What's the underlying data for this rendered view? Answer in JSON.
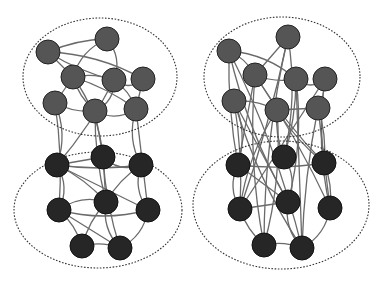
{
  "diagram": {
    "type": "network-community-comparison",
    "colors": {
      "top_node": "#555555",
      "bottom_node": "#262626",
      "edge": "#6a6a6a",
      "cluster_outline": "#333333"
    },
    "node_radius": 12,
    "panels": [
      {
        "id": "left",
        "clusters": [
          {
            "id": "top",
            "cx": 100,
            "cy": 77,
            "rx": 77,
            "ry": 59,
            "nodes": [
              [
                48,
                52
              ],
              [
                107,
                39
              ],
              [
                73,
                77
              ],
              [
                114,
                80
              ],
              [
                143,
                79
              ],
              [
                55,
                103
              ],
              [
                95,
                111
              ],
              [
                136,
                109
              ]
            ]
          },
          {
            "id": "bottom",
            "cx": 98,
            "cy": 210,
            "rx": 84,
            "ry": 58,
            "nodes": [
              [
                57,
                165
              ],
              [
                103,
                157
              ],
              [
                141,
                165
              ],
              [
                59,
                210
              ],
              [
                106,
                202
              ],
              [
                148,
                210
              ],
              [
                82,
                246
              ],
              [
                120,
                248
              ]
            ]
          }
        ],
        "intra_edges_top": [
          [
            0,
            1
          ],
          [
            0,
            2
          ],
          [
            0,
            3
          ],
          [
            1,
            2
          ],
          [
            1,
            3
          ],
          [
            2,
            3
          ],
          [
            2,
            5
          ],
          [
            2,
            6
          ],
          [
            3,
            4
          ],
          [
            3,
            6
          ],
          [
            3,
            7
          ],
          [
            4,
            7
          ],
          [
            5,
            6
          ],
          [
            6,
            7
          ],
          [
            0,
            4
          ],
          [
            2,
            7
          ]
        ],
        "intra_edges_bottom": [
          [
            0,
            1
          ],
          [
            0,
            2
          ],
          [
            1,
            2
          ],
          [
            0,
            3
          ],
          [
            0,
            4
          ],
          [
            1,
            4
          ],
          [
            2,
            4
          ],
          [
            2,
            5
          ],
          [
            3,
            4
          ],
          [
            3,
            6
          ],
          [
            3,
            7
          ],
          [
            4,
            6
          ],
          [
            4,
            7
          ],
          [
            5,
            7
          ],
          [
            6,
            7
          ],
          [
            0,
            5
          ],
          [
            1,
            7
          ],
          [
            3,
            5
          ]
        ],
        "inter_edges": [
          [
            5,
            0
          ],
          [
            5,
            3
          ],
          [
            6,
            1
          ],
          [
            6,
            4
          ],
          [
            7,
            2
          ],
          [
            2,
            1
          ],
          [
            3,
            0
          ],
          [
            7,
            5
          ]
        ]
      },
      {
        "id": "right",
        "clusters": [
          {
            "id": "top",
            "cx": 282,
            "cy": 77,
            "rx": 78,
            "ry": 60,
            "nodes": [
              [
                229,
                51
              ],
              [
                288,
                37
              ],
              [
                255,
                75
              ],
              [
                296,
                79
              ],
              [
                325,
                79
              ],
              [
                234,
                101
              ],
              [
                277,
                110
              ],
              [
                318,
                108
              ]
            ]
          },
          {
            "id": "bottom",
            "cx": 281,
            "cy": 205,
            "rx": 88,
            "ry": 64,
            "nodes": [
              [
                238,
                165
              ],
              [
                284,
                157
              ],
              [
                324,
                163
              ],
              [
                240,
                209
              ],
              [
                288,
                202
              ],
              [
                330,
                208
              ],
              [
                264,
                245
              ],
              [
                302,
                248
              ]
            ]
          }
        ],
        "intra_edges_top": [
          [
            0,
            2
          ],
          [
            1,
            2
          ],
          [
            2,
            3
          ],
          [
            3,
            4
          ],
          [
            0,
            3
          ],
          [
            5,
            6
          ],
          [
            6,
            7
          ]
        ],
        "intra_edges_bottom": [
          [
            0,
            2
          ],
          [
            0,
            3
          ],
          [
            1,
            4
          ],
          [
            2,
            5
          ],
          [
            3,
            4
          ],
          [
            3,
            6
          ],
          [
            4,
            7
          ],
          [
            5,
            7
          ],
          [
            6,
            7
          ],
          [
            0,
            4
          ]
        ],
        "inter_edges": [
          [
            0,
            0
          ],
          [
            0,
            4
          ],
          [
            1,
            1
          ],
          [
            1,
            3
          ],
          [
            2,
            0
          ],
          [
            2,
            2
          ],
          [
            2,
            6
          ],
          [
            3,
            4
          ],
          [
            3,
            1
          ],
          [
            3,
            7
          ],
          [
            4,
            2
          ],
          [
            4,
            5
          ],
          [
            5,
            0
          ],
          [
            5,
            3
          ],
          [
            5,
            4
          ],
          [
            6,
            1
          ],
          [
            6,
            3
          ],
          [
            6,
            6
          ],
          [
            7,
            2
          ],
          [
            7,
            5
          ],
          [
            7,
            7
          ],
          [
            1,
            6
          ],
          [
            0,
            7
          ],
          [
            2,
            5
          ],
          [
            4,
            3
          ],
          [
            6,
            2
          ],
          [
            5,
            7
          ]
        ]
      }
    ]
  }
}
